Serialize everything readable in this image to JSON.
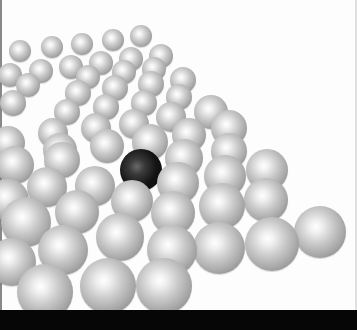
{
  "image": {
    "description": "3D rendering of a lattice of silver spheres with a single black sphere",
    "background_color": "#fdfdfd",
    "bottom_bar_color": "#060606",
    "sphere_color": "#c9c9c9",
    "dark_sphere_color": "#141414"
  },
  "spheres": [
    {
      "x": 141,
      "y": 36,
      "r": 11
    },
    {
      "x": 113,
      "y": 40,
      "r": 11
    },
    {
      "x": 82,
      "y": 44,
      "r": 11
    },
    {
      "x": 52,
      "y": 47,
      "r": 11
    },
    {
      "x": 20,
      "y": 51,
      "r": 11
    },
    {
      "x": 161,
      "y": 56,
      "r": 12
    },
    {
      "x": 131,
      "y": 59,
      "r": 12
    },
    {
      "x": 101,
      "y": 63,
      "r": 12
    },
    {
      "x": 71,
      "y": 67,
      "r": 12
    },
    {
      "x": 41,
      "y": 71,
      "r": 12
    },
    {
      "x": 10,
      "y": 75,
      "r": 12
    },
    {
      "x": 154,
      "y": 69,
      "r": 12
    },
    {
      "x": 124,
      "y": 72,
      "r": 12
    },
    {
      "x": 88,
      "y": 77,
      "r": 12
    },
    {
      "x": 28,
      "y": 85,
      "r": 12
    },
    {
      "x": 183,
      "y": 80,
      "r": 13
    },
    {
      "x": 151,
      "y": 84,
      "r": 13
    },
    {
      "x": 115,
      "y": 88,
      "r": 13
    },
    {
      "x": 78,
      "y": 93,
      "r": 13
    },
    {
      "x": 13,
      "y": 103,
      "r": 13
    },
    {
      "x": 179,
      "y": 97,
      "r": 13
    },
    {
      "x": 144,
      "y": 103,
      "r": 13
    },
    {
      "x": 106,
      "y": 107,
      "r": 13
    },
    {
      "x": 67,
      "y": 112,
      "r": 13
    },
    {
      "x": 211,
      "y": 112,
      "r": 17
    },
    {
      "x": 171,
      "y": 117,
      "r": 15
    },
    {
      "x": 134,
      "y": 124,
      "r": 15
    },
    {
      "x": 96,
      "y": 128,
      "r": 15
    },
    {
      "x": 53,
      "y": 133,
      "r": 15
    },
    {
      "x": 229,
      "y": 128,
      "r": 18
    },
    {
      "x": 189,
      "y": 135,
      "r": 17
    },
    {
      "x": 150,
      "y": 142,
      "r": 18
    },
    {
      "x": 107,
      "y": 146,
      "r": 17
    },
    {
      "x": 60,
      "y": 150,
      "r": 17
    },
    {
      "x": 8,
      "y": 143,
      "r": 17
    },
    {
      "x": 229,
      "y": 151,
      "r": 18
    },
    {
      "x": 184,
      "y": 158,
      "r": 19
    },
    {
      "x": 62,
      "y": 160,
      "r": 18
    },
    {
      "x": 15,
      "y": 165,
      "r": 19
    },
    {
      "x": 267,
      "y": 170,
      "r": 21
    },
    {
      "x": 225,
      "y": 176,
      "r": 21
    },
    {
      "x": 178,
      "y": 183,
      "r": 21
    },
    {
      "x": 95,
      "y": 186,
      "r": 20
    },
    {
      "x": 47,
      "y": 187,
      "r": 20
    },
    {
      "x": 266,
      "y": 200,
      "r": 22
    },
    {
      "x": 222,
      "y": 206,
      "r": 23
    },
    {
      "x": 173,
      "y": 213,
      "r": 22
    },
    {
      "x": 132,
      "y": 201,
      "r": 21
    },
    {
      "x": 77,
      "y": 212,
      "r": 22
    },
    {
      "x": 8,
      "y": 200,
      "r": 21
    },
    {
      "x": 320,
      "y": 232,
      "r": 26
    },
    {
      "x": 272,
      "y": 244,
      "r": 27
    },
    {
      "x": 219,
      "y": 248,
      "r": 26
    },
    {
      "x": 172,
      "y": 250,
      "r": 25
    },
    {
      "x": 120,
      "y": 237,
      "r": 24
    },
    {
      "x": 63,
      "y": 250,
      "r": 25
    },
    {
      "x": 26,
      "y": 222,
      "r": 25
    },
    {
      "x": 12,
      "y": 262,
      "r": 24
    },
    {
      "x": 164,
      "y": 286,
      "r": 28
    },
    {
      "x": 108,
      "y": 286,
      "r": 28
    },
    {
      "x": 45,
      "y": 292,
      "r": 28
    }
  ],
  "dark_sphere": {
    "x": 141,
    "y": 170,
    "r": 21
  }
}
